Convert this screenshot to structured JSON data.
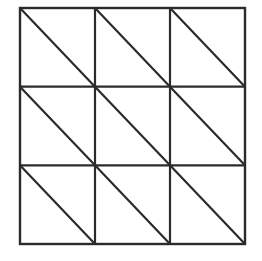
{
  "figure": {
    "background_color": "#ffffff",
    "line_color": "#2b2b2b",
    "outer_border_width": 2.4,
    "grid_line_width": 2.2,
    "diagonal_line_width": 2.2,
    "geometry": {
      "left": 20,
      "top": 8,
      "right": 245,
      "bottom": 244,
      "width": 225,
      "height": 236,
      "rows": 3,
      "columns": 3,
      "cell_width": 75,
      "cell_height": 78.67
    },
    "vertical_grid_lines_x": [
      95,
      170
    ],
    "horizontal_grid_lines_y": [
      86.67,
      165.33
    ],
    "cells": [
      {
        "row": 0,
        "col": 0,
        "diagonal": "top-left-to-bottom-right"
      },
      {
        "row": 0,
        "col": 1,
        "diagonal": "top-left-to-bottom-right"
      },
      {
        "row": 0,
        "col": 2,
        "diagonal": "top-left-to-bottom-right"
      },
      {
        "row": 1,
        "col": 0,
        "diagonal": "top-left-to-bottom-right"
      },
      {
        "row": 1,
        "col": 1,
        "diagonal": "top-left-to-bottom-right"
      },
      {
        "row": 1,
        "col": 2,
        "diagonal": "top-left-to-bottom-right"
      },
      {
        "row": 2,
        "col": 0,
        "diagonal": "top-left-to-bottom-right"
      },
      {
        "row": 2,
        "col": 1,
        "diagonal": "top-left-to-bottom-right"
      },
      {
        "row": 2,
        "col": 2,
        "diagonal": "top-left-to-bottom-right"
      }
    ]
  }
}
